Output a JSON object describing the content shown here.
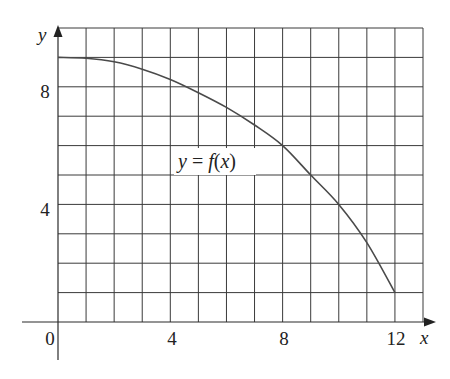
{
  "chart_data": {
    "type": "line",
    "title": "",
    "xlabel": "x",
    "ylabel": "y",
    "xlim": [
      0,
      13
    ],
    "ylim": [
      0,
      10
    ],
    "grid": true,
    "x_ticks": [
      0,
      4,
      8,
      12
    ],
    "y_ticks": [
      4,
      8
    ],
    "x_tick_labels": [
      "0",
      "4",
      "8",
      "12"
    ],
    "y_tick_labels": [
      "4",
      "8"
    ],
    "origin_label": "0",
    "series": [
      {
        "name": "y = f(x)",
        "x": [
          0,
          1,
          2,
          3,
          4,
          5,
          6,
          7,
          8,
          9,
          10,
          11,
          12
        ],
        "y": [
          9,
          8.97,
          8.85,
          8.6,
          8.25,
          7.8,
          7.3,
          6.7,
          6.0,
          5.0,
          4.0,
          2.7,
          1.0
        ]
      }
    ],
    "annotations": [
      {
        "text": "y = f(x)",
        "x": 5.6,
        "y": 5.5
      }
    ]
  },
  "labels": {
    "x_axis": "x",
    "y_axis": "y",
    "origin": "0",
    "x_tick_4": "4",
    "x_tick_8": "8",
    "x_tick_12": "12",
    "y_tick_4": "4",
    "y_tick_8": "8",
    "function_var": "y",
    "function_eq": " = ",
    "function_name": "f",
    "function_arg_open": "(",
    "function_arg": "x",
    "function_arg_close": ")"
  },
  "colors": {
    "grid": "#3a3a3a",
    "curve": "#4a4a4a",
    "background": "#ffffff"
  }
}
